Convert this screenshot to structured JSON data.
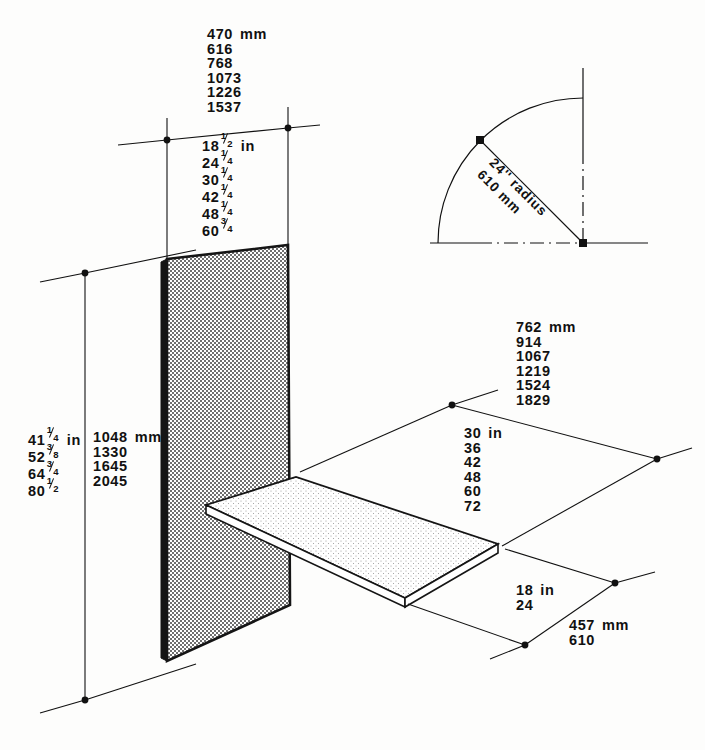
{
  "drawing": {
    "title": "Isometric dimension drawing of wall panel and shelf",
    "ink_color": "#111111",
    "background_color": "#fdfdfc",
    "panel_fill": "#d6d6d6",
    "shelf_fill": "#f2f2f0"
  },
  "panel_width_mm": {
    "unit": "mm",
    "values": [
      "470",
      "616",
      "768",
      "1073",
      "1226",
      "1537"
    ]
  },
  "panel_width_in": {
    "unit": "in",
    "values": [
      {
        "whole": "18",
        "num": "1",
        "den": "2"
      },
      {
        "whole": "24",
        "num": "1",
        "den": "4"
      },
      {
        "whole": "30",
        "num": "1",
        "den": "4"
      },
      {
        "whole": "42",
        "num": "1",
        "den": "4"
      },
      {
        "whole": "48",
        "num": "1",
        "den": "4"
      },
      {
        "whole": "60",
        "num": "3",
        "den": "4"
      }
    ]
  },
  "panel_height": {
    "unit_in": "in",
    "unit_mm": "mm",
    "inches": [
      {
        "whole": "41",
        "num": "1",
        "den": "4"
      },
      {
        "whole": "52",
        "num": "3",
        "den": "8"
      },
      {
        "whole": "64",
        "num": "3",
        "den": "4"
      },
      {
        "whole": "80",
        "num": "1",
        "den": "2"
      }
    ],
    "mm": [
      "1048",
      "1330",
      "1645",
      "2045"
    ]
  },
  "shelf_length_mm": {
    "unit": "mm",
    "values": [
      "762",
      "914",
      "1067",
      "1219",
      "1524",
      "1829"
    ]
  },
  "shelf_length_in": {
    "unit": "in",
    "values": [
      "30",
      "36",
      "42",
      "48",
      "60",
      "72"
    ]
  },
  "shelf_depth_in": {
    "unit": "in",
    "values": [
      "18",
      "24"
    ]
  },
  "shelf_depth_mm": {
    "unit": "mm",
    "values": [
      "457",
      "610"
    ]
  },
  "radius_detail": {
    "line1": "24'' radius",
    "line2": "610 mm"
  }
}
